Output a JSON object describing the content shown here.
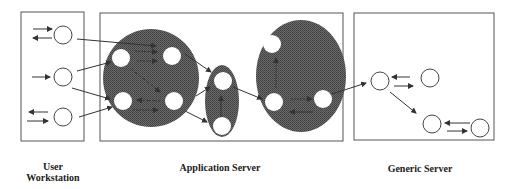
{
  "diagram": {
    "type": "architecture",
    "groups": [
      {
        "id": "user-workstation",
        "label_lines": [
          "User",
          "Workstation"
        ]
      },
      {
        "id": "application-server",
        "label_lines": [
          "Application Server"
        ]
      },
      {
        "id": "generic-server",
        "label_lines": [
          "Generic Server"
        ]
      }
    ],
    "colors": {
      "box_border": "#555555",
      "cluster_fill": "#5a5a5a",
      "node_fill": "#ffffff",
      "node_border": "#444444",
      "arrow": "#333333"
    }
  }
}
